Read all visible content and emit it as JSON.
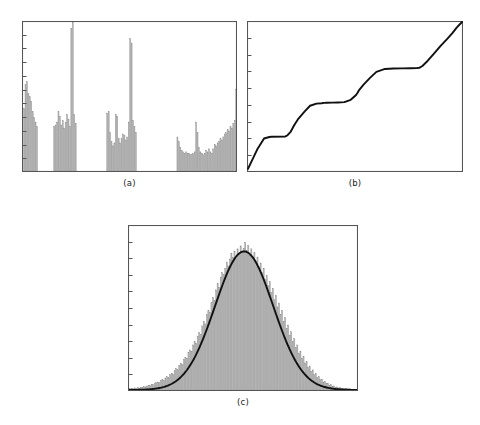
{
  "figure": {
    "background_color": "#ffffff",
    "width": 480,
    "height": 425,
    "bar_fill_color": "#b4b4b4",
    "bar_edge_color": "#8c8c8c",
    "axis_color": "#555555",
    "curve_color": "#111111",
    "caption_color": "#1a1a1a"
  },
  "panels": [
    {
      "id": "panel-a",
      "caption": "(a)",
      "frame": {
        "x": 22,
        "y": 21,
        "width": 215,
        "height": 151
      },
      "y_tick_count": 11,
      "chart_index": 0
    },
    {
      "id": "panel-b",
      "caption": "(b)",
      "frame": {
        "x": 247,
        "y": 21,
        "width": 216,
        "height": 151
      },
      "y_tick_count": 9,
      "chart_index": 1
    },
    {
      "id": "panel-c",
      "caption": "(c)",
      "frame": {
        "x": 128,
        "y": 225,
        "width": 230,
        "height": 166
      },
      "y_tick_count": 10,
      "chart_index": 2
    }
  ],
  "chart_data": [
    {
      "type": "bar",
      "panel": "(a)",
      "title": "",
      "subtitle": "",
      "xlabel": "",
      "ylabel": "",
      "grid": false,
      "legend": null,
      "annotations": [],
      "xlim": [
        0,
        150
      ],
      "ylim": [
        0,
        1.0
      ],
      "x_tick_labels": [],
      "y_tick_labels": [],
      "description": "Sparse spiky histogram with four separated clusters of bars and two very tall isolated spikes; gaps of zero-height bins between clusters.",
      "values": [
        0.0,
        0.42,
        0.58,
        0.6,
        0.52,
        0.5,
        0.47,
        0.4,
        0.36,
        0.33,
        0.3,
        0.0,
        0.0,
        0.0,
        0.0,
        0.0,
        0.0,
        0.0,
        0.0,
        0.0,
        0.0,
        0.0,
        0.3,
        0.31,
        0.33,
        0.4,
        0.37,
        0.31,
        0.34,
        0.29,
        0.33,
        0.38,
        0.35,
        0.3,
        0.96,
        1.0,
        0.38,
        0.32,
        0.0,
        0.0,
        0.0,
        0.0,
        0.0,
        0.0,
        0.0,
        0.0,
        0.0,
        0.0,
        0.0,
        0.0,
        0.0,
        0.0,
        0.0,
        0.0,
        0.0,
        0.0,
        0.0,
        0.0,
        0.0,
        0.39,
        0.4,
        0.26,
        0.2,
        0.17,
        0.19,
        0.38,
        0.37,
        0.22,
        0.19,
        0.22,
        0.25,
        0.24,
        0.21,
        0.23,
        0.33,
        0.89,
        0.86,
        0.34,
        0.3,
        0.26,
        0.0,
        0.0,
        0.0,
        0.0,
        0.0,
        0.0,
        0.0,
        0.0,
        0.0,
        0.0,
        0.0,
        0.0,
        0.0,
        0.0,
        0.0,
        0.0,
        0.0,
        0.0,
        0.0,
        0.0,
        0.0,
        0.0,
        0.0,
        0.0,
        0.0,
        0.0,
        0.0,
        0.0,
        0.23,
        0.2,
        0.16,
        0.14,
        0.13,
        0.12,
        0.13,
        0.12,
        0.12,
        0.11,
        0.11,
        0.12,
        0.13,
        0.33,
        0.26,
        0.16,
        0.13,
        0.12,
        0.11,
        0.12,
        0.14,
        0.13,
        0.15,
        0.13,
        0.12,
        0.15,
        0.18,
        0.17,
        0.19,
        0.2,
        0.22,
        0.21,
        0.23,
        0.25,
        0.26,
        0.28,
        0.27,
        0.3,
        0.29,
        0.32,
        0.34,
        0.55
      ]
    },
    {
      "type": "line",
      "panel": "(b)",
      "title": "",
      "subtitle": "",
      "xlabel": "",
      "ylabel": "",
      "grid": false,
      "legend": null,
      "annotations": [],
      "xlim": [
        0,
        1
      ],
      "ylim": [
        0,
        1
      ],
      "x_tick_labels": [],
      "y_tick_labels": [],
      "description": "Monotone increasing cumulative distribution (staircase / ogive) with three flat plateaus separated by steep rises.",
      "series": [
        {
          "name": "cumulative",
          "x": [
            0.0,
            0.02,
            0.045,
            0.075,
            0.1,
            0.11,
            0.175,
            0.185,
            0.2,
            0.215,
            0.235,
            0.265,
            0.29,
            0.32,
            0.345,
            0.35,
            0.355,
            0.37,
            0.395,
            0.42,
            0.45,
            0.48,
            0.505,
            0.512,
            0.52,
            0.54,
            0.57,
            0.6,
            0.64,
            0.68,
            0.72,
            0.76,
            0.79,
            0.8,
            0.815,
            0.84,
            0.87,
            0.9,
            0.93,
            0.955,
            0.975,
            1.0
          ],
          "y": [
            0.015,
            0.075,
            0.15,
            0.218,
            0.228,
            0.23,
            0.232,
            0.24,
            0.265,
            0.305,
            0.35,
            0.4,
            0.438,
            0.452,
            0.455,
            0.456,
            0.457,
            0.458,
            0.459,
            0.46,
            0.462,
            0.478,
            0.51,
            0.525,
            0.545,
            0.58,
            0.625,
            0.665,
            0.685,
            0.688,
            0.689,
            0.69,
            0.691,
            0.692,
            0.705,
            0.74,
            0.79,
            0.84,
            0.885,
            0.925,
            0.962,
            1.0
          ]
        }
      ]
    },
    {
      "type": "bar",
      "panel": "(c)",
      "title": "",
      "subtitle": "",
      "xlabel": "",
      "ylabel": "",
      "grid": false,
      "legend": null,
      "annotations": [],
      "xlim": [
        -4,
        4
      ],
      "ylim": [
        0,
        1.0
      ],
      "x_tick_labels": [],
      "y_tick_labels": [],
      "description": "Noisy normal-shaped histogram (approximately 100 bins) overlaid with a smooth black Gaussian fit curve; bell centred slightly right of centre.",
      "overlay_curve": {
        "name": "gaussian-fit",
        "type": "gaussian",
        "mean": 0.04,
        "sigma": 1.02,
        "peak": 0.845,
        "color": "#111111"
      },
      "values": [
        0.01,
        0.01,
        0.012,
        0.01,
        0.014,
        0.012,
        0.016,
        0.013,
        0.018,
        0.017,
        0.022,
        0.02,
        0.026,
        0.03,
        0.028,
        0.036,
        0.033,
        0.042,
        0.046,
        0.05,
        0.048,
        0.06,
        0.065,
        0.058,
        0.075,
        0.082,
        0.078,
        0.095,
        0.104,
        0.098,
        0.12,
        0.132,
        0.126,
        0.15,
        0.165,
        0.158,
        0.186,
        0.2,
        0.194,
        0.228,
        0.246,
        0.238,
        0.276,
        0.298,
        0.286,
        0.33,
        0.352,
        0.342,
        0.392,
        0.418,
        0.404,
        0.462,
        0.488,
        0.474,
        0.536,
        0.566,
        0.548,
        0.612,
        0.652,
        0.628,
        0.69,
        0.718,
        0.704,
        0.742,
        0.782,
        0.758,
        0.8,
        0.836,
        0.81,
        0.848,
        0.806,
        0.862,
        0.83,
        0.88,
        0.838,
        0.866,
        0.9,
        0.852,
        0.884,
        0.822,
        0.862,
        0.814,
        0.84,
        0.788,
        0.812,
        0.752,
        0.776,
        0.716,
        0.744,
        0.678,
        0.7,
        0.64,
        0.664,
        0.596,
        0.622,
        0.552,
        0.578,
        0.508,
        0.532,
        0.462,
        0.488,
        0.42,
        0.442,
        0.378,
        0.398,
        0.336,
        0.356,
        0.298,
        0.314,
        0.26,
        0.276,
        0.226,
        0.238,
        0.194,
        0.206,
        0.166,
        0.176,
        0.14,
        0.148,
        0.116,
        0.124,
        0.096,
        0.102,
        0.078,
        0.084,
        0.064,
        0.068,
        0.05,
        0.054,
        0.04,
        0.042,
        0.031,
        0.033,
        0.024,
        0.026,
        0.018,
        0.02,
        0.014,
        0.015,
        0.011,
        0.012,
        0.009,
        0.009,
        0.007,
        0.008,
        0.006,
        0.006,
        0.005,
        0.005,
        0.004
      ]
    }
  ]
}
